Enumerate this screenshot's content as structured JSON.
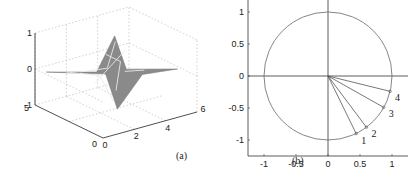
{
  "chart_data": [
    {
      "type": "surface",
      "caption": "(a)",
      "x_ticks": [
        "0",
        "2",
        "4",
        "6"
      ],
      "y_ticks": [
        "0",
        "5"
      ],
      "z_ticks": [
        "-1",
        "0",
        "1"
      ],
      "xlim": [
        0,
        6
      ],
      "ylim": [
        0,
        5
      ],
      "zlim": [
        -1,
        1
      ],
      "grid": true,
      "surface_color": "#8a8a8a",
      "mesh_color": "#e8e8e8",
      "description": "Star-shaped surface with peak near z=1 and trough near z=-1, flat at z=0 elsewhere"
    },
    {
      "type": "line",
      "caption": "(b)",
      "x_ticks": [
        "-1",
        "-0.5",
        "0",
        "0.5",
        "1"
      ],
      "y_ticks": [
        "1",
        "0.5",
        "0",
        "-0.5",
        "-1"
      ],
      "xlim": [
        -1.25,
        1.25
      ],
      "ylim": [
        -1.25,
        1.25
      ],
      "unit_circle": true,
      "axes_through_origin": true,
      "vectors": [
        {
          "label": "1",
          "x": 0.44,
          "y": -0.9
        },
        {
          "label": "2",
          "x": 0.6,
          "y": -0.8
        },
        {
          "label": "3",
          "x": 0.87,
          "y": -0.49
        },
        {
          "label": "4",
          "x": 0.97,
          "y": -0.24
        }
      ],
      "line_color": "#555555"
    }
  ]
}
